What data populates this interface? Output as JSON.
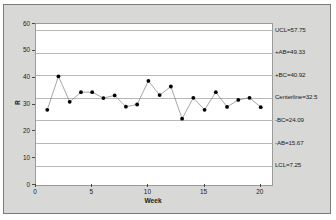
{
  "chart_data": {
    "type": "line",
    "title": "",
    "xlabel": "Week",
    "ylabel": "R",
    "xlim": [
      0,
      21
    ],
    "ylim": [
      0,
      60
    ],
    "grid": true,
    "legend": "none",
    "x_ticks": [
      "0",
      "5",
      "10",
      "15",
      "20"
    ],
    "x_tick_values": [
      0,
      5,
      10,
      15,
      20
    ],
    "y_ticks": [
      "0",
      "10",
      "20",
      "30",
      "40",
      "50",
      "60"
    ],
    "y_tick_values": [
      0,
      10,
      20,
      30,
      40,
      50,
      60
    ],
    "x": [
      1,
      2,
      3,
      4,
      5,
      6,
      7,
      8,
      9,
      10,
      11,
      12,
      13,
      14,
      15,
      16,
      17,
      18,
      19,
      20
    ],
    "values": [
      28.0,
      40.5,
      31.0,
      34.6,
      34.6,
      32.4,
      33.4,
      29.2,
      30.0,
      38.8,
      33.5,
      36.7,
      24.7,
      32.5,
      28.0,
      34.6,
      29.1,
      31.7,
      32.5,
      29.0
    ],
    "series": [
      {
        "name": "R",
        "values": [
          28.0,
          40.5,
          31.0,
          34.6,
          34.6,
          32.4,
          33.4,
          29.2,
          30.0,
          38.8,
          33.5,
          36.7,
          24.7,
          32.5,
          28.0,
          34.6,
          29.1,
          31.7,
          32.5,
          29.0
        ]
      }
    ],
    "control_limits": [
      {
        "key": "ucl",
        "label": "UCL=57.75",
        "value": 57.75
      },
      {
        "key": "plus_ab",
        "label": "+AB=49.33",
        "value": 49.33
      },
      {
        "key": "plus_bc",
        "label": "+BC=40.92",
        "value": 40.92
      },
      {
        "key": "centerline",
        "label": "Centerline=32.5",
        "value": 32.5
      },
      {
        "key": "minus_bc",
        "label": "-BC=24.09",
        "value": 24.09
      },
      {
        "key": "minus_ab",
        "label": "-AB=15.67",
        "value": 15.67
      },
      {
        "key": "lcl",
        "label": "LCL=7.25",
        "value": 7.25
      }
    ],
    "colors": {
      "marker": "#000000",
      "line": "#808080",
      "gridline": "#b9b9b7",
      "plot_background": "#ffffff",
      "frame_background": "#d8d8d6",
      "frame_border": "#7a7a78",
      "text": "#1b1b1b"
    }
  }
}
